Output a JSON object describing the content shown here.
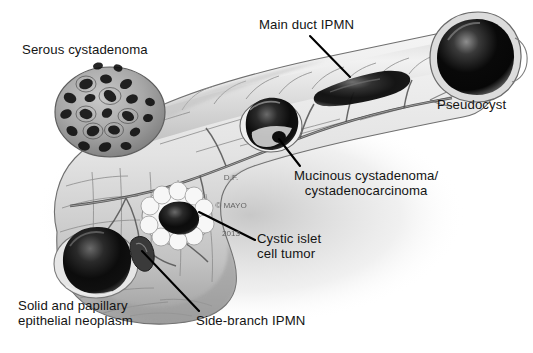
{
  "figure": {
    "style": "grayscale medical illustration",
    "background_color": "#ffffff",
    "label_color": "#141414",
    "leader_line_color": "#000000",
    "width": 533,
    "height": 353
  },
  "watermark": {
    "line1": "D.F.",
    "line2": "© MAYO",
    "line3": "2013",
    "color": "#5b5b5b"
  },
  "labels": {
    "serous": "Serous cystadenoma",
    "main_duct": "Main duct IPMN",
    "pseudocyst": "Pseudocyst",
    "mucinous": "Mucinous cystadenoma/\ncystadenocarcinoma",
    "cystic_islet": "Cystic islet\ncell tumor",
    "solid_papillary": "Solid and papillary\nepithelial neoplasm",
    "side_branch": "Side-branch IPMN"
  },
  "anatomy": {
    "regions": [
      "pancreatic head",
      "uncinate process",
      "pancreatic neck",
      "pancreatic body",
      "pancreatic tail"
    ],
    "duct": "main pancreatic duct with side branches"
  },
  "lesions": [
    {
      "name": "Serous cystadenoma",
      "appearance": "honeycomb cluster of many small dark microcysts",
      "location": "superior pancreatic body / neck",
      "x": 110,
      "y": 112
    },
    {
      "name": "Main duct IPMN",
      "appearance": "dilated dark main duct segment",
      "location": "pancreatic body toward tail",
      "x": 352,
      "y": 78
    },
    {
      "name": "Pseudocyst",
      "appearance": "large round dark unilocular cyst",
      "location": "pancreatic tail",
      "x": 477,
      "y": 57
    },
    {
      "name": "Mucinous cystadenoma/cystadenocarcinoma",
      "appearance": "dark cyst with internal septation",
      "location": "pancreatic body",
      "x": 271,
      "y": 126
    },
    {
      "name": "Cystic islet cell tumor",
      "appearance": "pale rimmed cyst with dark center",
      "location": "pancreatic head",
      "x": 177,
      "y": 215
    },
    {
      "name": "Solid and papillary epithelial neoplasm",
      "appearance": "large dark rounded mass",
      "location": "inferior pancreatic head",
      "x": 96,
      "y": 264
    },
    {
      "name": "Side-branch IPMN",
      "appearance": "small dilated side branch of duct",
      "location": "uncinate process",
      "x": 141,
      "y": 251
    }
  ],
  "leader_lines": [
    {
      "name": "main-duct-leader",
      "x1": 310,
      "y1": 36,
      "x2": 350,
      "y2": 77
    },
    {
      "name": "mucinous-leader",
      "x1": 300,
      "y1": 166,
      "x2": 279,
      "y2": 139
    },
    {
      "name": "cystic-islet-leader",
      "x1": 255,
      "y1": 240,
      "x2": 199,
      "y2": 212
    },
    {
      "name": "side-branch-leader",
      "x1": 199,
      "y1": 311,
      "x2": 142,
      "y2": 251
    }
  ]
}
